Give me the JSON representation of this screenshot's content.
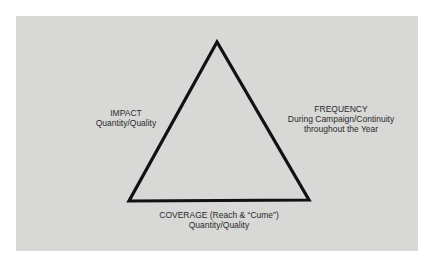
{
  "diagram": {
    "type": "triangle",
    "background_color": "#ffffff",
    "panel_color": "#d8d8d6",
    "stroke_color": "#111111",
    "vertices": {
      "apex": [
        217,
        41
      ],
      "bottom_left": [
        129,
        201
      ],
      "bottom_right": [
        309,
        200
      ]
    },
    "labels": {
      "impact": {
        "title": "IMPACT",
        "subtitle": "Quantity/Quality"
      },
      "frequency": {
        "title": "FREQUENCY",
        "line2": "During Campaign/Continuity",
        "line3": "throughout the Year"
      },
      "coverage": {
        "title": "COVERAGE (Reach & “Cume”)",
        "subtitle": "Quantity/Quality"
      }
    }
  }
}
